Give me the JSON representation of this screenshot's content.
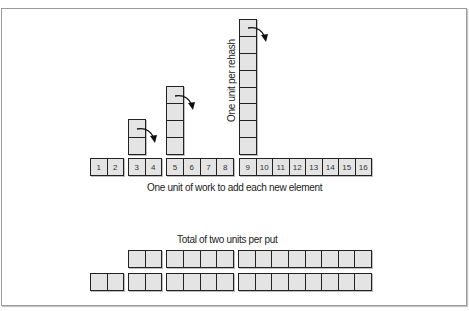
{
  "diagram": {
    "labels": {
      "work_label": "One unit of work to add each new element",
      "rehash_label": "One unit per rehash",
      "total_label": "Total of two units per put"
    },
    "main_row": {
      "groups": [
        {
          "cells": [
            "1",
            "2"
          ]
        },
        {
          "cells": [
            "3",
            "4"
          ]
        },
        {
          "cells": [
            "5",
            "6",
            "7",
            "8"
          ]
        },
        {
          "cells": [
            "9",
            "10",
            "11",
            "12",
            "13",
            "14",
            "15",
            "16"
          ]
        }
      ]
    },
    "rehash_stacks": [
      {
        "above_cell": "3",
        "height_units": 2
      },
      {
        "above_cell": "5",
        "height_units": 4
      },
      {
        "above_cell": "9",
        "height_units": 8
      }
    ],
    "total_rows": {
      "top_row_groups": [
        2,
        4,
        8
      ],
      "bottom_row_groups": [
        2,
        2,
        4,
        8
      ]
    },
    "colors": {
      "box_fill": "#e4e4e4",
      "box_border": "#222222",
      "frame_border": "#9a9a9a"
    }
  }
}
